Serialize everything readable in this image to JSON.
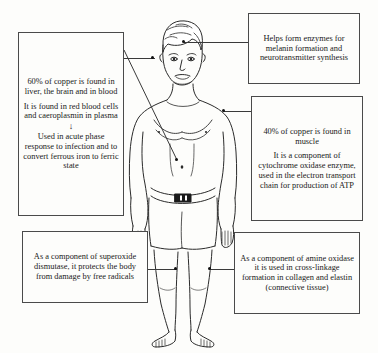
{
  "diagram": {
    "figure_name": "human-body-line-drawing",
    "line_color": "#3a3a3a",
    "box_border_color": "#4a4a4a",
    "background_color": "#fdfdfb",
    "text_color": "#191919"
  },
  "callouts": {
    "liver": {
      "name": "callout-liver-brain-blood",
      "anchor": "head-left-eye",
      "paragraphs": [
        "60% of copper is found in liver, the brain and in blood",
        "It is found in red blood cells and caeroplasmin in plasma"
      ],
      "arrow": "↓",
      "final_paragraph": "Used in acute phase response to infection and to convert ferrous iron to ferric state"
    },
    "enzymes": {
      "name": "callout-melanin-enzymes",
      "anchor": "head-right-eye",
      "paragraphs": [
        "Helps form enzymes for melanin formation and neurotransmitter synthesis"
      ]
    },
    "muscle": {
      "name": "callout-muscle-cytochrome",
      "anchor": "right-chest-muscle",
      "paragraphs": [
        "40% of copper is found in muscle",
        "It is a component of cytochrome oxidase enzyme, used in the electron transport chain for production of ATP"
      ]
    },
    "sod": {
      "name": "callout-superoxide-dismutase",
      "anchor": "left-knee",
      "paragraphs": [
        "As a component of superoxide dismutase, it protects the body from damage by free radicals"
      ]
    },
    "amine": {
      "name": "callout-amine-oxidase",
      "anchor": "right-knee",
      "paragraphs": [
        "As a component of amine oxidase it is used in cross-linkage formation in collagen and elastin (connective tissue)"
      ]
    }
  },
  "anchor_points": [
    {
      "name": "anchor-dot-left-eye",
      "x": 153,
      "y": 58
    },
    {
      "name": "anchor-dot-right-eye",
      "x": 184,
      "y": 42
    },
    {
      "name": "anchor-dot-right-chest",
      "x": 224,
      "y": 111
    },
    {
      "name": "anchor-dot-abdomen",
      "x": 177,
      "y": 160
    },
    {
      "name": "anchor-dot-left-knee",
      "x": 176,
      "y": 269
    },
    {
      "name": "anchor-dot-right-knee",
      "x": 210,
      "y": 269
    }
  ]
}
